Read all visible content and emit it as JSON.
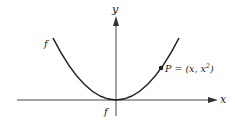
{
  "diagram": {
    "axes": {
      "x_label": "x",
      "y_label": "y"
    },
    "curve": {
      "equation": "y = x^2",
      "label_left": "f",
      "label_bottom": "f"
    },
    "point": {
      "label_prefix": "P = (x, x",
      "label_sup": "2",
      "label_suffix": ")"
    },
    "colors": {
      "stroke": "#222222",
      "background": "#ffffff"
    }
  }
}
